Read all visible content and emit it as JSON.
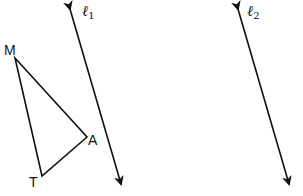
{
  "diagram": {
    "type": "geometry",
    "triangle": {
      "vertices": {
        "M": {
          "label": "M",
          "x": 15,
          "y": 58
        },
        "A": {
          "label": "A",
          "x": 87,
          "y": 137
        },
        "T": {
          "label": "T",
          "x": 42,
          "y": 176
        }
      }
    },
    "lines": [
      {
        "name": "l1",
        "symbol": "ℓ",
        "subscript": "1",
        "x1": 68,
        "y1": 3,
        "x2": 123,
        "y2": 190
      },
      {
        "name": "l2",
        "symbol": "ℓ",
        "subscript": "2",
        "x1": 236,
        "y1": 3,
        "x2": 291,
        "y2": 190
      }
    ],
    "stroke_color": "#111111"
  }
}
